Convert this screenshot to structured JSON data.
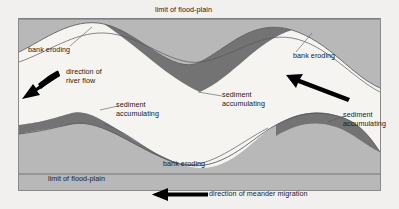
{
  "diagram": {
    "colors": {
      "page_background": "#f2f0ee",
      "floodplain_gray": "#b8b8b8",
      "channel_light": "#f5f4f1",
      "sediment_dark": "#737373",
      "line_stroke": "#55585c",
      "border": "#8a8a8a",
      "text": "#1a1a1a",
      "arrow": "#000000"
    },
    "labels": {
      "limit_top": "limit of flood-plain",
      "limit_bottom": "limit of flood-plain",
      "bank_eroding_top_left": "bank eroding",
      "bank_eroding_top_right": "bank eroding",
      "bank_eroding_bottom": "bank eroding",
      "sediment_top_middle": "sediment accumulating",
      "sediment_mid_left": "sediment accumulating",
      "sediment_mid_right": "sediment accumulating",
      "direction_river_flow": "direction of river flow",
      "direction_meander_migration": "direction of meander migration"
    },
    "arrows": [
      {
        "name": "river-flow-arrow",
        "direction": "down-left",
        "label": "direction of river flow"
      },
      {
        "name": "river-flow-arrow-right",
        "direction": "up-left",
        "label": ""
      },
      {
        "name": "meander-migration-arrow",
        "direction": "left",
        "label": "direction of meander migration"
      }
    ]
  }
}
